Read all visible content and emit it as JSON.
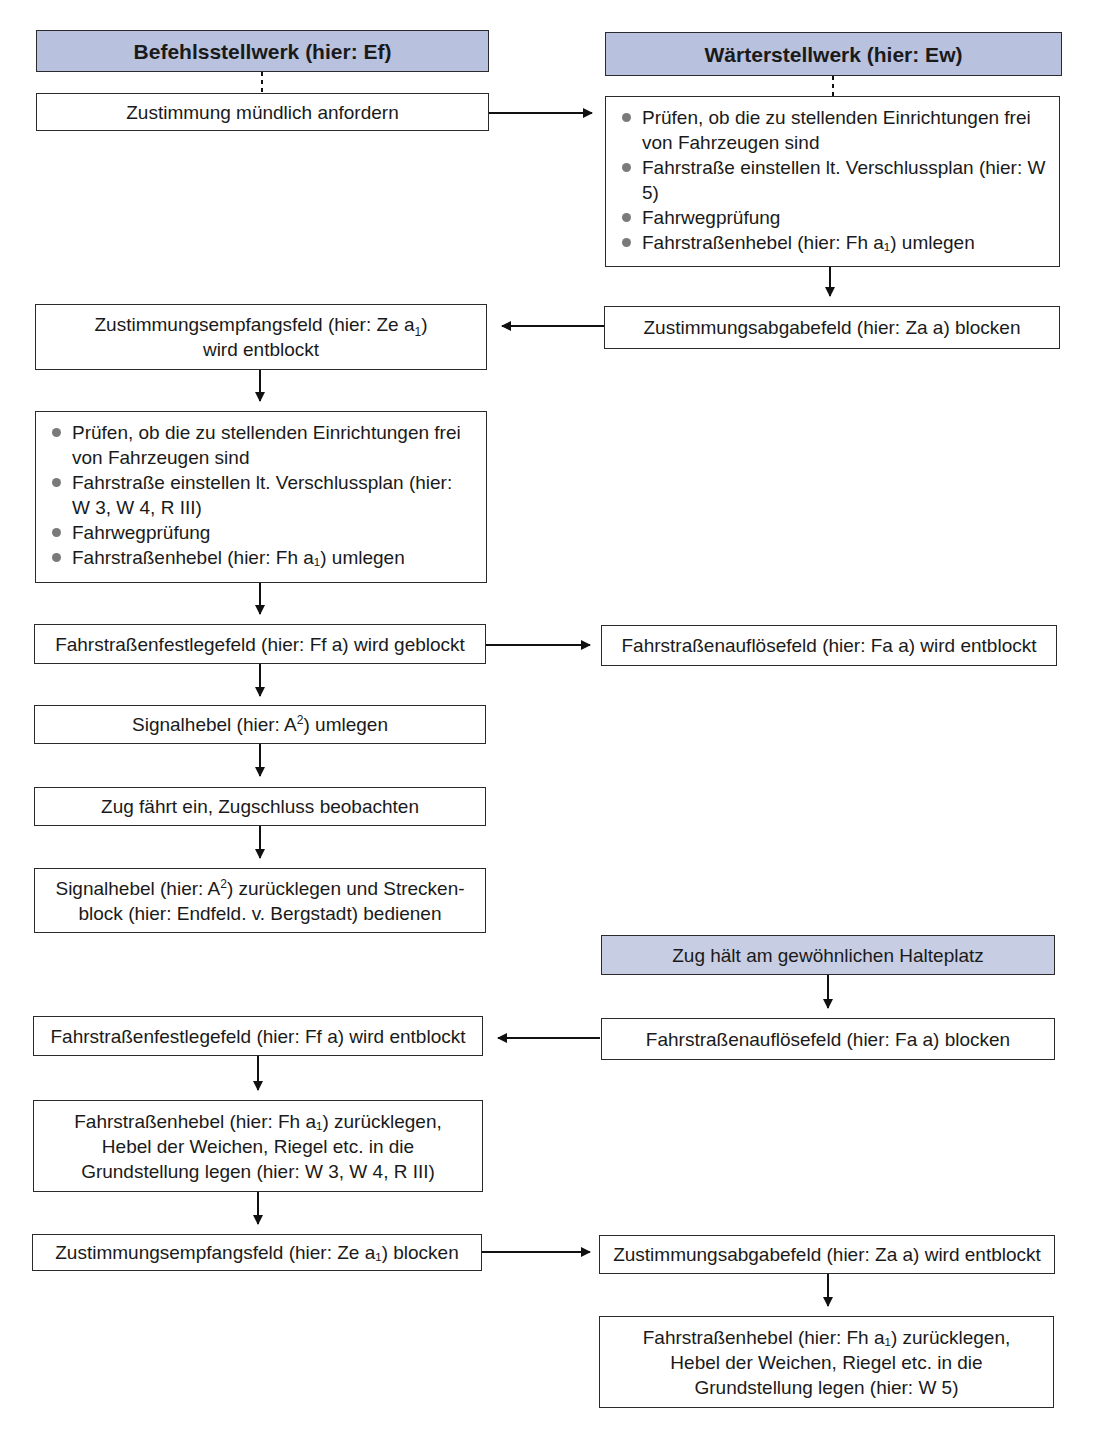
{
  "headers": {
    "left": "Befehlsstellwerk (hier: Ef)",
    "right": "Wärterstellwerk (hier: Ew)"
  },
  "left_column": {
    "step1": "Zustimmung mündlich anfordern",
    "step2_line1_a": "Zustimmungsempfangsfeld (hier: Ze a",
    "step2_sub": "1",
    "step2_line1_b": ")",
    "step2_line2": "wird entblockt",
    "step3_items": [
      "Prüfen, ob die zu stellenden Einrichtungen frei von Fahrzeugen sind",
      "Fahrstraße einstellen lt. Verschlussplan (hier: W 3, W 4, R III)",
      "Fahrwegprüfung",
      "Fahrstraßenhebel (hier: Fh a₁) umlegen"
    ],
    "step4": "Fahrstraßenfestlegefeld (hier: Ff a) wird geblockt",
    "step5_a": "Signalhebel (hier: A",
    "step5_sup": "2",
    "step5_b": ") umlegen",
    "step6": "Zug fährt ein, Zugschluss beobachten",
    "step7_a": "Signalhebel (hier: A",
    "step7_sup": "2",
    "step7_b": ") zurücklegen und Strecken-",
    "step7_line2": "block (hier: Endfeld. v. Bergstadt) bedienen",
    "step8": "Fahrstraßenfestlegefeld (hier: Ff a) wird entblockt",
    "step9_line1": "Fahrstraßenhebel (hier: Fh a₁) zurücklegen,",
    "step9_line2": "Hebel der Weichen, Riegel etc. in die",
    "step9_line3": "Grundstellung legen (hier: W 3, W 4, R III)",
    "step10": "Zustimmungsempfangsfeld (hier: Ze a₁) blocken"
  },
  "right_column": {
    "step1_items": [
      "Prüfen, ob die zu stellenden Einrichtungen frei von Fahrzeugen sind",
      "Fahrstraße einstellen lt. Verschlussplan (hier: W 5)",
      "Fahrwegprüfung",
      "Fahrstraßenhebel (hier: Fh a₁) umlegen"
    ],
    "step2": "Zustimmungsabgabefeld (hier: Za a) blocken",
    "step3": "Fahrstraßenauflösefeld (hier: Fa a) wird entblockt",
    "step4": "Zug hält am gewöhnlichen Halteplatz",
    "step5": "Fahrstraßenauflösefeld (hier: Fa a) blocken",
    "step6": "Zustimmungsabgabefeld (hier: Za a) wird entblockt",
    "step7_line1": "Fahrstraßenhebel (hier: Fh a₁) zurücklegen,",
    "step7_line2": "Hebel der Weichen, Riegel etc. in die",
    "step7_line3": "Grundstellung legen (hier: W 5)"
  },
  "colors": {
    "header_fill": "#b8c1dd",
    "border": "#2b2b2b",
    "bullet": "#7a7a7a"
  }
}
